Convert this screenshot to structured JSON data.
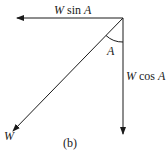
{
  "diagram": {
    "labels": {
      "horizontal_component": {
        "var": "W",
        "fn": " sin ",
        "angle": "A"
      },
      "vertical_component": {
        "var": "W",
        "fn": " cos ",
        "angle": "A"
      },
      "resultant": "W",
      "angle": "A",
      "caption": "(b)"
    },
    "colors": {
      "line": "#1a1a1a",
      "background": "#ffffff"
    }
  }
}
